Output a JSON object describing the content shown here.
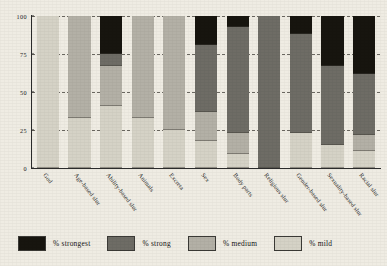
{
  "chart_data": {
    "type": "bar",
    "subtype": "stacked-bar-100",
    "title": "",
    "xlabel": "",
    "ylabel": "",
    "ylim": [
      0,
      100
    ],
    "yticks": [
      0,
      25,
      50,
      75,
      100
    ],
    "ytick_labels": [
      "0",
      "25",
      "50",
      "75",
      "100"
    ],
    "grid": "horizontal-dashed",
    "legend_position": "bottom",
    "orientation": "vertical",
    "categories": [
      "God",
      "Age-based slur",
      "Ability-based slur",
      "Animals",
      "Excreta",
      "Sex",
      "Body parts",
      "Religious slur",
      "Gender-based slur",
      "Sexuality-based slur",
      "Racial slur"
    ],
    "series": [
      {
        "name": "% strongest",
        "color": "#17150f",
        "values": [
          0,
          0,
          25,
          0,
          0,
          19,
          7,
          0,
          12,
          33,
          38
        ]
      },
      {
        "name": "% strong",
        "color": "#6e6c65",
        "values": [
          0,
          0,
          8,
          0,
          0,
          44,
          70,
          100,
          65,
          52,
          40
        ]
      },
      {
        "name": "% medium",
        "color": "#b3b0a6",
        "values": [
          0,
          67,
          26,
          67,
          75,
          19,
          14,
          0,
          0,
          0,
          11
        ]
      },
      {
        "name": "% mild",
        "color": "#d5d2c6",
        "values": [
          100,
          33,
          41,
          33,
          25,
          18,
          9,
          0,
          23,
          15,
          11
        ]
      }
    ]
  },
  "legend": {
    "items": [
      {
        "label": "% strongest",
        "color": "#17150f"
      },
      {
        "label": "% strong",
        "color": "#6e6c65"
      },
      {
        "label": "% medium",
        "color": "#b3b0a6"
      },
      {
        "label": "% mild",
        "color": "#d5d2c6"
      }
    ]
  },
  "axes": {
    "y_tick_labels": [
      "100",
      "75",
      "50",
      "25",
      "0"
    ]
  }
}
